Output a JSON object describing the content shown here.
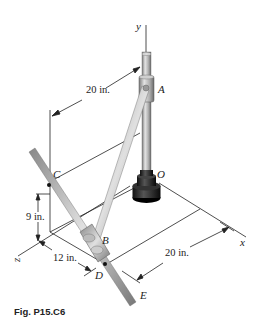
{
  "caption": "Fig. P15.C6",
  "axes": {
    "x": "x",
    "y": "y",
    "z": "z"
  },
  "points": {
    "A": "A",
    "B": "B",
    "C": "C",
    "D": "D",
    "E": "E",
    "O": "O"
  },
  "dimensions": {
    "ac_horizontal": "20 in.",
    "c_height": "9 in.",
    "z_offset": "12 in.",
    "d_x_offset": "20 in."
  },
  "colors": {
    "rod_light": "#d8d8d8",
    "rod_mid": "#a8a8a8",
    "rod_dark": "#6a6a6a",
    "base": "#1a1a1a",
    "line": "#222222"
  }
}
